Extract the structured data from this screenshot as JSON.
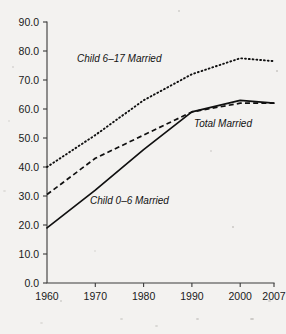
{
  "chart_data": {
    "type": "line",
    "title": "",
    "subtitle": "",
    "xlabel": "",
    "ylabel": "",
    "x": [
      1960,
      1970,
      1980,
      1990,
      2000,
      2007
    ],
    "xtick_labels": [
      "1960",
      "1970",
      "1980",
      "1990",
      "2000",
      "2007"
    ],
    "ytick_labels": [
      "0.0",
      "10.0",
      "20.0",
      "30.0",
      "40.0",
      "50.0",
      "60.0",
      "70.0",
      "80.0",
      "90.0"
    ],
    "ytick_values": [
      0,
      10,
      20,
      30,
      40,
      50,
      60,
      70,
      80,
      90
    ],
    "ylim": [
      0,
      90
    ],
    "xlim": [
      1960,
      2007
    ],
    "grid": false,
    "legend": "inline-annotations",
    "series": [
      {
        "name": "Child 6-17 Married",
        "label": "Child 6–17 Married",
        "style": "dotted",
        "color": "#101010",
        "values": [
          40.0,
          51.0,
          63.0,
          72.0,
          77.5,
          76.5
        ]
      },
      {
        "name": "Total Married",
        "label": "Total Married",
        "style": "dashed",
        "color": "#101010",
        "values": [
          30.5,
          43.0,
          51.0,
          59.0,
          62.0,
          62.0
        ]
      },
      {
        "name": "Child 0-6 Married",
        "label": "Child 0–6 Married",
        "style": "solid",
        "color": "#101010",
        "values": [
          19.0,
          32.0,
          46.0,
          59.0,
          63.0,
          62.0
        ]
      }
    ],
    "annotations": [
      {
        "text": "Child 6–17 Married",
        "x_px": 77,
        "y_px": 62
      },
      {
        "text": "Total Married",
        "x_px": 194,
        "y_px": 127
      },
      {
        "text": "Child 0–6 Married",
        "x_px": 90,
        "y_px": 204
      }
    ]
  },
  "axes": {
    "plot_left_px": 47,
    "plot_right_px": 274,
    "plot_top_px": 22,
    "plot_bottom_px": 283,
    "axis_color": "#3a3a3a"
  },
  "page": {
    "background_color": "#f3f2f0",
    "foreground_color": "#101010"
  }
}
